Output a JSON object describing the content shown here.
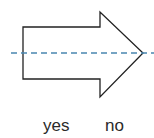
{
  "diagram": {
    "shape": "arrow-right",
    "symmetry_line": "horizontal-dashed",
    "colors": {
      "outline": "#222222",
      "dashed_line": "#4a86b0",
      "background": "#ffffff"
    }
  },
  "options": {
    "yes": "yes",
    "no": "no"
  }
}
